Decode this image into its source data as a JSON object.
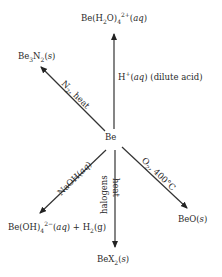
{
  "diagram": {
    "center": {
      "label": "Be"
    },
    "products": [
      {
        "id": "be-aqua",
        "formula": "Be(H2O)4 2+ (aq)",
        "parts": {
          "pre": "Be(H",
          "sub1": "2",
          "mid": "O)",
          "sub2": "4",
          "sup": "2+",
          "phase": "aq"
        }
      },
      {
        "id": "be3n2",
        "formula": "Be3N2(s)",
        "parts": {
          "a": "Be",
          "s1": "3",
          "b": "N",
          "s2": "2",
          "phase": "s"
        }
      },
      {
        "id": "be-hydroxo",
        "formula": "Be(OH)4 2- (aq) + H2(g)",
        "parts": {
          "a": "Be(OH)",
          "sub": "4",
          "sup": "2−",
          "phase1": "aq",
          "plus": "+ H",
          "sub2": "2",
          "phase2": "g"
        }
      },
      {
        "id": "bex2",
        "formula": "BeX2(s)",
        "parts": {
          "a": "BeX",
          "sub": "2",
          "phase": "s"
        }
      },
      {
        "id": "beo",
        "formula": "BeO(s)",
        "parts": {
          "a": "BeO",
          "phase": "s"
        }
      }
    ],
    "conditions": {
      "acid": {
        "text": "H⁺(aq) (dilute acid)",
        "a": "H",
        "sup": "+",
        "phase": "aq",
        "note": "(dilute acid)"
      },
      "nitrogen": {
        "a": "N",
        "sub": "2",
        "b": ", heat"
      },
      "naoh": {
        "a": "NaOH(",
        "phase": "aq",
        "b": ")"
      },
      "halogens": {
        "a": "halogens",
        "b": "heat"
      },
      "oxygen": {
        "a": "O",
        "sub": "2",
        "b": ", 400°C"
      }
    },
    "arrow_color": "#222222"
  }
}
